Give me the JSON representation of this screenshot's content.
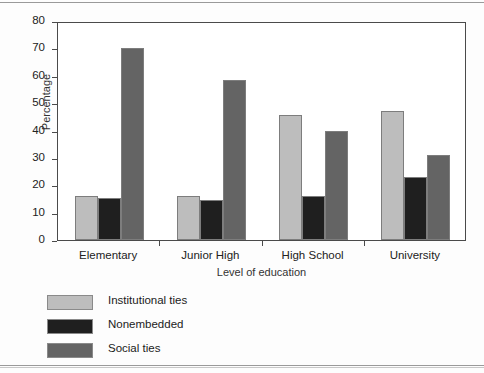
{
  "chart_data": {
    "type": "bar",
    "title": "",
    "subtitle": "",
    "xlabel": "Level of education",
    "ylabel": "Percentage",
    "categories": [
      "Elementary",
      "Junior High",
      "High School",
      "University"
    ],
    "series": [
      {
        "name": "Institutional ties",
        "color": "#bdbdbd",
        "values": [
          16,
          16,
          45.5,
          47
        ]
      },
      {
        "name": "Nonembedded",
        "color": "#1f1f1f",
        "values": [
          15.5,
          14.5,
          16,
          23
        ]
      },
      {
        "name": "Social ties",
        "color": "#646464",
        "values": [
          70,
          58.5,
          40,
          31
        ]
      }
    ],
    "ylim": [
      0,
      80
    ],
    "ytick_values": [
      0,
      10,
      20,
      30,
      40,
      50,
      60,
      70,
      80
    ],
    "ytick_labels": [
      "0",
      "10",
      "20",
      "30",
      "40",
      "50",
      "60",
      "70",
      "80"
    ],
    "grid": false,
    "legend_position": "below-left",
    "frame": true,
    "bar_border_color": "#7d7d7d",
    "axis_color": "#4a4a4a",
    "plot_background": "#ffffff",
    "figure_background": "#fdfdfd"
  }
}
